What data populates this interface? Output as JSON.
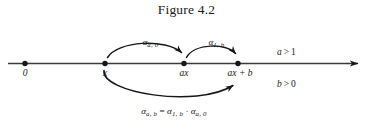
{
  "figure": {
    "title": "Figure 4.2",
    "background_color": "#ffffff",
    "ink_color": "#17171a"
  },
  "number_line": {
    "name": "real-number-line",
    "arrow_direction": "right",
    "points": [
      {
        "id": "origin",
        "label": "0",
        "x_px": 25
      },
      {
        "id": "x",
        "label": "x",
        "x_px": 105
      },
      {
        "id": "ax",
        "label_prefix": "ax",
        "label": "ax",
        "x_px": 184
      },
      {
        "id": "ax_plus_b",
        "label": "ax + b",
        "label_prefix": "ax",
        "label_op": " + ",
        "label_suffix": "b",
        "x_px": 238
      }
    ]
  },
  "arcs": {
    "upper_left": {
      "name": "arc-alpha-a-0",
      "from": "x",
      "to": "ax",
      "label_alpha": "α",
      "label_subscript": "a, 0",
      "label_x_px": 146,
      "label_y_px": 30
    },
    "upper_right": {
      "name": "arc-alpha-1-b",
      "from": "ax",
      "to": "ax_plus_b",
      "label_alpha": "α",
      "label_subscript": "1, b",
      "label_x_px": 212,
      "label_y_px": 30
    },
    "lower": {
      "name": "arc-alpha-a-b",
      "from": "x",
      "to": "ax_plus_b"
    }
  },
  "equation": {
    "name": "composition-equation",
    "alpha": "α",
    "lhs_subscript": "a, b",
    "equals": " = ",
    "term1_subscript": "1, b",
    "dot": " · ",
    "term2_subscript": "a, 0"
  },
  "conditions": [
    {
      "var": "a",
      "op": ">",
      "value": "1"
    },
    {
      "var": "b",
      "op": ">",
      "value": "0"
    }
  ]
}
